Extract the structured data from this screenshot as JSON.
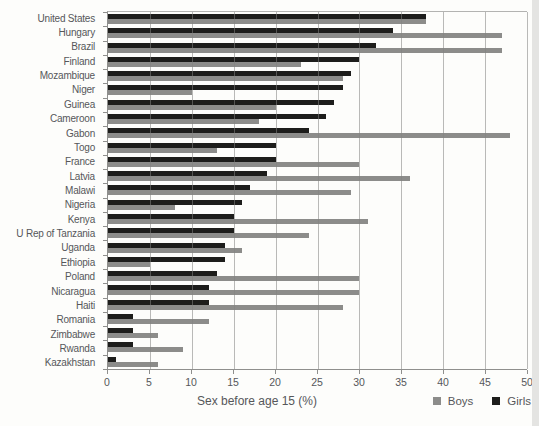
{
  "chart_data": {
    "type": "bar",
    "orientation": "horizontal",
    "xlabel": "Sex before age 15 (%)",
    "xlim": [
      0,
      50
    ],
    "xticks": [
      0,
      5,
      10,
      15,
      20,
      25,
      30,
      35,
      40,
      45,
      50
    ],
    "grid": "vertical",
    "legend_position": "bottom-right",
    "colors": {
      "boys": "#8c8c8a",
      "girls": "#1d1d1b"
    },
    "legend": [
      {
        "name": "Boys",
        "color": "#8c8c8a"
      },
      {
        "name": "Girls",
        "color": "#1d1d1b"
      }
    ],
    "categories": [
      "United States",
      "Hungary",
      "Brazil",
      "Finland",
      "Mozambique",
      "Niger",
      "Guinea",
      "Cameroon",
      "Gabon",
      "Togo",
      "France",
      "Latvia",
      "Malawi",
      "Nigeria",
      "Kenya",
      "U Rep of Tanzania",
      "Uganda",
      "Ethiopia",
      "Poland",
      "Nicaragua",
      "Haiti",
      "Romania",
      "Zimbabwe",
      "Rwanda",
      "Kazakhstan"
    ],
    "series": [
      {
        "name": "Girls",
        "color": "#1d1d1b",
        "values": [
          38,
          34,
          32,
          30,
          29,
          28,
          27,
          26,
          24,
          20,
          20,
          19,
          17,
          16,
          15,
          15,
          14,
          14,
          13,
          12,
          12,
          3,
          3,
          3,
          1
        ]
      },
      {
        "name": "Boys",
        "color": "#8c8c8a",
        "values": [
          38,
          47,
          47,
          23,
          28,
          10,
          20,
          18,
          48,
          13,
          30,
          36,
          29,
          8,
          31,
          24,
          16,
          5,
          30,
          30,
          28,
          12,
          6,
          9,
          6
        ]
      }
    ]
  }
}
